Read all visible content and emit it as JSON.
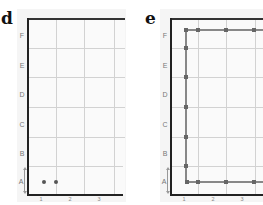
{
  "figure": {
    "panels": [
      {
        "letter": "d",
        "y_labels": [
          "F",
          "E",
          "D",
          "C",
          "B",
          "A"
        ],
        "x_labels": [
          "1",
          "2",
          "3"
        ],
        "points": [
          {
            "row": "A",
            "x": 1.0
          },
          {
            "row": "A",
            "x": 1.4
          }
        ]
      },
      {
        "letter": "e",
        "y_labels": [
          "F",
          "E",
          "D",
          "C",
          "B",
          "A"
        ],
        "x_labels": [
          "1",
          "2",
          "3"
        ],
        "path_description": "Rectangular path along rows F and A connected by a vertical segment at x=1",
        "points_top_row_F": [
          1.0,
          1.4,
          2.4,
          3.4
        ],
        "points_left_column": [
          "F",
          "E/F",
          "D/E",
          "C/D",
          "B/C",
          "A/B",
          "A"
        ],
        "points_bottom_row_A": [
          1.0,
          1.4,
          2.4,
          3.4
        ]
      }
    ],
    "colors": {
      "axis": "#222222",
      "grid": "#d2d2d2",
      "points": "#555555",
      "path": "#888888",
      "panel_bg": "#f5f5f5"
    }
  }
}
